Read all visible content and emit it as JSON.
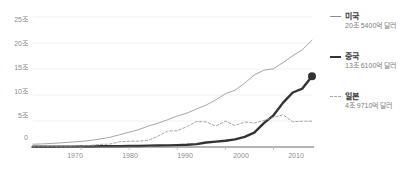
{
  "chart_data": {
    "type": "line",
    "title": "",
    "subtitle": "",
    "xlabel": "",
    "ylabel": "",
    "xlim": [
      1960,
      2018
    ],
    "ylim": [
      0,
      25
    ],
    "grid": true,
    "legend_position": "right",
    "y_ticks": [
      "0",
      "5조",
      "10조",
      "15조",
      "20조",
      "25조"
    ],
    "y_tick_values": [
      0,
      5,
      10,
      15,
      20,
      25
    ],
    "x_ticks": [
      "1970",
      "1980",
      "1990",
      "2000",
      "2010"
    ],
    "x_tick_values": [
      1970,
      1980,
      1990,
      2000,
      2010
    ],
    "unit_note": "조 달러",
    "x": [
      1960,
      1962,
      1964,
      1966,
      1968,
      1970,
      1972,
      1974,
      1976,
      1978,
      1980,
      1982,
      1984,
      1986,
      1988,
      1990,
      1992,
      1994,
      1996,
      1998,
      2000,
      2002,
      2004,
      2006,
      2008,
      2010,
      2012,
      2014,
      2016,
      2018
    ],
    "series": [
      {
        "name": "미국",
        "label": "미국",
        "value_label": "20조 5400억 달러",
        "color": "#a6a6a6",
        "style": "solid",
        "width": 1,
        "end_marker": false,
        "values": [
          0.54,
          0.6,
          0.69,
          0.82,
          0.94,
          1.07,
          1.28,
          1.55,
          1.87,
          2.35,
          2.86,
          3.34,
          4.04,
          4.58,
          5.25,
          5.96,
          6.52,
          7.31,
          8.07,
          9.06,
          10.25,
          10.93,
          12.27,
          13.86,
          14.77,
          15.05,
          16.25,
          17.55,
          18.7,
          20.54
        ]
      },
      {
        "name": "중국",
        "label": "중국",
        "value_label": "13조 6100억 달러",
        "color": "#333333",
        "style": "solid",
        "width": 2.4,
        "end_marker": true,
        "values": [
          0.06,
          0.05,
          0.06,
          0.07,
          0.07,
          0.09,
          0.11,
          0.14,
          0.15,
          0.15,
          0.19,
          0.2,
          0.26,
          0.3,
          0.31,
          0.36,
          0.43,
          0.56,
          0.86,
          1.03,
          1.21,
          1.47,
          1.96,
          2.75,
          4.6,
          6.09,
          8.53,
          10.48,
          11.23,
          13.61
        ]
      },
      {
        "name": "일본",
        "label": "일본",
        "value_label": "4조 9710억 달러",
        "color": "#9b9b9b",
        "style": "dashed",
        "width": 0.9,
        "end_marker": false,
        "values": [
          0.04,
          0.06,
          0.08,
          0.11,
          0.15,
          0.21,
          0.32,
          0.5,
          0.57,
          1.01,
          1.1,
          1.13,
          1.3,
          2.08,
          3.07,
          3.13,
          3.91,
          4.91,
          4.83,
          4.03,
          4.97,
          4.12,
          4.82,
          4.6,
          5.1,
          5.7,
          6.2,
          4.85,
          4.95,
          4.97
        ]
      }
    ]
  },
  "axis": {
    "y_labels": [
      {
        "text": "25조",
        "top": 14
      },
      {
        "text": "20조",
        "top": 38
      },
      {
        "text": "15조",
        "top": 62
      },
      {
        "text": "10조",
        "top": 86
      },
      {
        "text": "5조",
        "top": 110
      },
      {
        "text": "0",
        "top": 134
      }
    ],
    "x_labels": [
      {
        "text": "1970",
        "left": 60
      },
      {
        "text": "1980",
        "left": 115
      },
      {
        "text": "1990",
        "left": 170
      },
      {
        "text": "2000",
        "left": 226
      },
      {
        "text": "2010",
        "left": 281
      }
    ]
  },
  "legend": {
    "entries": [
      {
        "name": "미국",
        "value": "20조 5400억 달러",
        "top": 10,
        "color": "#8f8f8f",
        "style": "solid"
      },
      {
        "name": "중국",
        "value": "13조 6100억 달러",
        "top": 50,
        "color": "#333333",
        "style": "solid"
      },
      {
        "name": "일본",
        "value": "4조 9710억 달러",
        "top": 90,
        "color": "#a8a8a8",
        "style": "dashed"
      }
    ]
  }
}
